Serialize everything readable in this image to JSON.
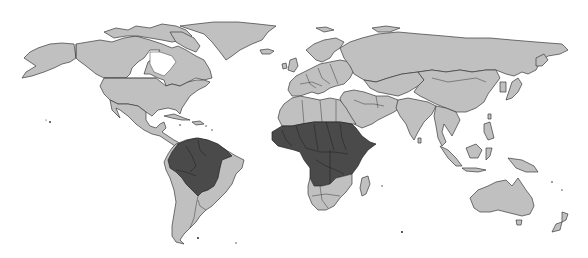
{
  "map": {
    "type": "world choropleth",
    "projection": "equirectangular-like",
    "legend": [],
    "colors": {
      "background": "#ffffff",
      "land_default": "#c0c0c0",
      "land_highlighted": "#4a4a4a",
      "border": "#3a3a3a"
    },
    "highlighted_regions": [
      "Tropical South America (Amazon basin: Brazil north/west, Venezuela, Colombia, Peru, Bolivia, Guyana, Suriname, French Guiana, Ecuador)",
      "Sub-Saharan Africa (West, Central and East Africa between Sahara and Angola/Zambia/Tanzania)"
    ]
  }
}
